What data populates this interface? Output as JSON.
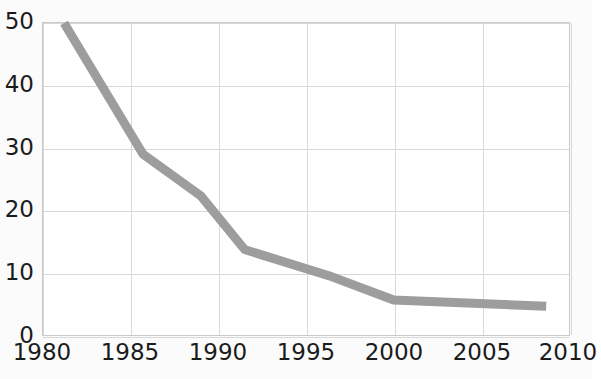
{
  "chart_data": {
    "type": "line",
    "title": "",
    "subtitle": "",
    "xlabel": "",
    "ylabel": "",
    "xlim": [
      1980,
      2010
    ],
    "ylim": [
      0,
      50
    ],
    "grid": true,
    "legend": false,
    "legend_position": "none",
    "line_color": "#9d9d9d",
    "grid_color": "#d8d8d8",
    "axis_color": "#c9c9c9",
    "text_color": "#1b1b1b",
    "background": "#ffffff",
    "x_ticks": [
      "1980",
      "1985",
      "1990",
      "1995",
      "2000",
      "2005",
      "2010"
    ],
    "x_tick_values": [
      1980,
      1985,
      1990,
      1995,
      2000,
      2005,
      2010
    ],
    "y_ticks": [
      "0",
      "10",
      "20",
      "30",
      "40",
      "50"
    ],
    "y_tick_values": [
      0,
      10,
      20,
      30,
      40,
      50
    ],
    "series": [
      {
        "name": "series-1",
        "color": "#9d9d9d",
        "x": [
          1981.2,
          1985.7,
          1989.0,
          1991.5,
          1996.3,
          2000.0,
          2008.7
        ],
        "y": [
          50.0,
          29.0,
          22.3,
          13.7,
          9.5,
          5.6,
          4.6
        ],
        "points": [
          {
            "x": 1981.2,
            "y": 50.0
          },
          {
            "x": 1985.7,
            "y": 29.0
          },
          {
            "x": 1989.0,
            "y": 22.3
          },
          {
            "x": 1991.5,
            "y": 13.7
          },
          {
            "x": 1996.3,
            "y": 9.5
          },
          {
            "x": 2000.0,
            "y": 5.6
          },
          {
            "x": 2008.7,
            "y": 4.6
          }
        ]
      }
    ],
    "annotations": []
  },
  "axes": {
    "y_labels": [
      "50",
      "40",
      "30",
      "20",
      "10",
      "0"
    ],
    "x_labels": [
      "1980",
      "1985",
      "1990",
      "1995",
      "2000",
      "2005",
      "2010"
    ]
  }
}
